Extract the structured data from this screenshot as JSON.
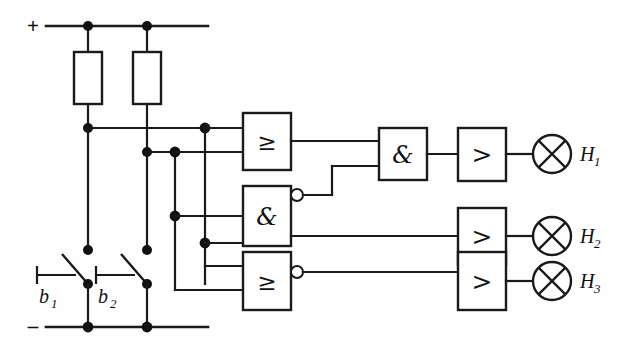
{
  "diagram": {
    "stroke_color": "#1a1a1a",
    "background_color": "#fefefe",
    "power_rails": {
      "positive_label": "+",
      "negative_label": "–"
    },
    "components": {
      "resistors": [
        {
          "name": "resistor-1",
          "label": ""
        },
        {
          "name": "resistor-2",
          "label": ""
        }
      ],
      "switches": [
        {
          "name": "switch-b1",
          "label": "b",
          "subscript": "1",
          "type": "pushbutton-normally-open"
        },
        {
          "name": "switch-b2",
          "label": "b",
          "subscript": "2",
          "type": "pushbutton-normally-open"
        }
      ],
      "gates": [
        {
          "name": "or-gate-1",
          "glyph": "≥",
          "type": "OR",
          "inverted_output": false
        },
        {
          "name": "nand-gate-1",
          "glyph": "&",
          "type": "NAND",
          "inverted_output": true
        },
        {
          "name": "nor-gate-1",
          "glyph": "≥",
          "type": "NOR",
          "inverted_output": true
        },
        {
          "name": "and-gate-1",
          "glyph": "&",
          "type": "AND",
          "inverted_output": false
        }
      ],
      "amplifiers": [
        {
          "name": "amplifier-1",
          "glyph": ">"
        },
        {
          "name": "amplifier-2",
          "glyph": ">"
        },
        {
          "name": "amplifier-3",
          "glyph": ">"
        }
      ],
      "lamps": [
        {
          "name": "lamp-h1",
          "label": "H",
          "subscript": "1"
        },
        {
          "name": "lamp-h2",
          "label": "H",
          "subscript": "2"
        },
        {
          "name": "lamp-h3",
          "label": "H",
          "subscript": "3"
        }
      ]
    }
  }
}
